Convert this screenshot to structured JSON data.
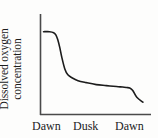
{
  "figure": {
    "background_color": "#fdfdfc",
    "ink_color": "#1c1c1c",
    "axis_color": "#4a4a4a"
  },
  "ylabel": {
    "line1": "Dissolved oxygen",
    "line2": "concentration"
  },
  "xticklabels": [
    "Dawn",
    "Dusk",
    "Dawn"
  ],
  "chart_data": {
    "type": "line",
    "title": "",
    "xlabel": "",
    "ylabel": "Dissolved oxygen concentration",
    "grid": false,
    "legend": null,
    "axis_style": "left-and-bottom-spines-only",
    "x_tick_labels": [
      "Dawn",
      "Dusk",
      "Dawn"
    ],
    "x_tick_positions": [
      0,
      0.5,
      1.0
    ],
    "xlim": [
      0,
      1.08
    ],
    "ylim": [
      0,
      1
    ],
    "y_tick_labels": [],
    "annotations": [],
    "series": [
      {
        "name": "Dissolved oxygen concentration",
        "color": "#1c1c1c",
        "line_width": 1.6,
        "description": "High plateau at dawn, steep decline through the morning, long shallow decline across the day to dusk, then a final sharp drop just before the next dawn.",
        "x": [
          0.02,
          0.08,
          0.12,
          0.14,
          0.16,
          0.18,
          0.2,
          0.23,
          0.26,
          0.3,
          0.36,
          0.44,
          0.54,
          0.64,
          0.74,
          0.8,
          0.84,
          0.87,
          0.9,
          0.94,
          1.0
        ],
        "y": [
          0.84,
          0.84,
          0.83,
          0.81,
          0.76,
          0.68,
          0.58,
          0.46,
          0.4,
          0.37,
          0.34,
          0.32,
          0.3,
          0.29,
          0.28,
          0.275,
          0.27,
          0.265,
          0.24,
          0.17,
          0.12
        ]
      }
    ]
  }
}
